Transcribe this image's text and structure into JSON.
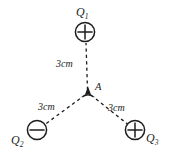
{
  "diagram": {
    "background_color": "#ffffff",
    "stroke_color": "#1c1c1c",
    "canvas": {
      "width": 172,
      "height": 156
    },
    "charges": [
      {
        "id": "Q1",
        "label_base": "Q",
        "label_sub": "1",
        "sign": "+",
        "symbol": "circled-plus",
        "cx": 85,
        "cy": 32,
        "r": 10
      },
      {
        "id": "Q2",
        "label_base": "Q",
        "label_sub": "2",
        "sign": "-",
        "symbol": "circled-minus",
        "cx": 37,
        "cy": 130,
        "r": 10
      },
      {
        "id": "Q3",
        "label_base": "Q",
        "label_sub": "3",
        "sign": "+",
        "symbol": "circled-plus",
        "cx": 135,
        "cy": 130,
        "r": 10
      }
    ],
    "center_point": {
      "id": "A",
      "label": "A",
      "cx": 88,
      "cy": 93,
      "marker": "triangle-star-marker"
    },
    "connectors": [
      {
        "id": "A-to-Q1",
        "from": "A",
        "to": "Q1",
        "style": "dashed",
        "distance_label": "3cm"
      },
      {
        "id": "A-to-Q2",
        "from": "A",
        "to": "Q2",
        "style": "dashed",
        "distance_label": "3cm"
      },
      {
        "id": "A-to-Q3",
        "from": "A",
        "to": "Q3",
        "style": "dashed",
        "distance_label": "3cm"
      }
    ]
  }
}
